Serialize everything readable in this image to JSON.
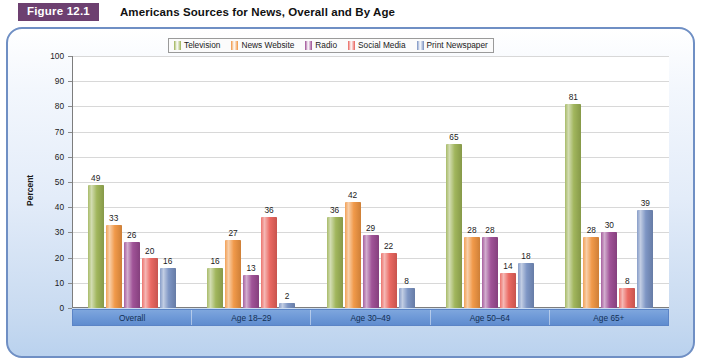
{
  "figure": {
    "badge": "Figure 12.1",
    "title": "Americans Sources for News, Overall and By Age"
  },
  "colors": {
    "television": "#9cb254",
    "news_website": "#f09440",
    "radio": "#9b4a92",
    "social_media": "#e9615a",
    "print_newspaper": "#7790c1",
    "panel_border": "#6f8fc4",
    "axis_band": "#6f9ad8",
    "badge": "#6d4070"
  },
  "chart_data": {
    "type": "bar",
    "title": "Americans Sources for News, Overall and By Age",
    "xlabel": "",
    "ylabel": "Percent",
    "ylim": [
      0,
      100
    ],
    "ytick_labels": [
      "100",
      "90",
      "80",
      "70",
      "60",
      "50",
      "40",
      "30",
      "20",
      "10",
      "0"
    ],
    "ytick_values": [
      100,
      90,
      80,
      70,
      60,
      50,
      40,
      30,
      20,
      10,
      0
    ],
    "grid": true,
    "legend_position": "top",
    "categories": [
      "Overall",
      "Age 18–29",
      "Age 30–49",
      "Age 50–64",
      "Age 65+"
    ],
    "series": [
      {
        "name": "Television",
        "color": "#9cb254",
        "values": [
          49,
          16,
          36,
          65,
          81
        ]
      },
      {
        "name": "News Website",
        "color": "#f09440",
        "values": [
          33,
          27,
          42,
          28,
          28
        ]
      },
      {
        "name": "Radio",
        "color": "#9b4a92",
        "values": [
          26,
          13,
          29,
          28,
          30
        ]
      },
      {
        "name": "Social Media",
        "color": "#e9615a",
        "values": [
          20,
          36,
          22,
          14,
          8
        ]
      },
      {
        "name": "Print Newspaper",
        "color": "#7790c1",
        "values": [
          16,
          2,
          8,
          18,
          39
        ]
      }
    ]
  }
}
